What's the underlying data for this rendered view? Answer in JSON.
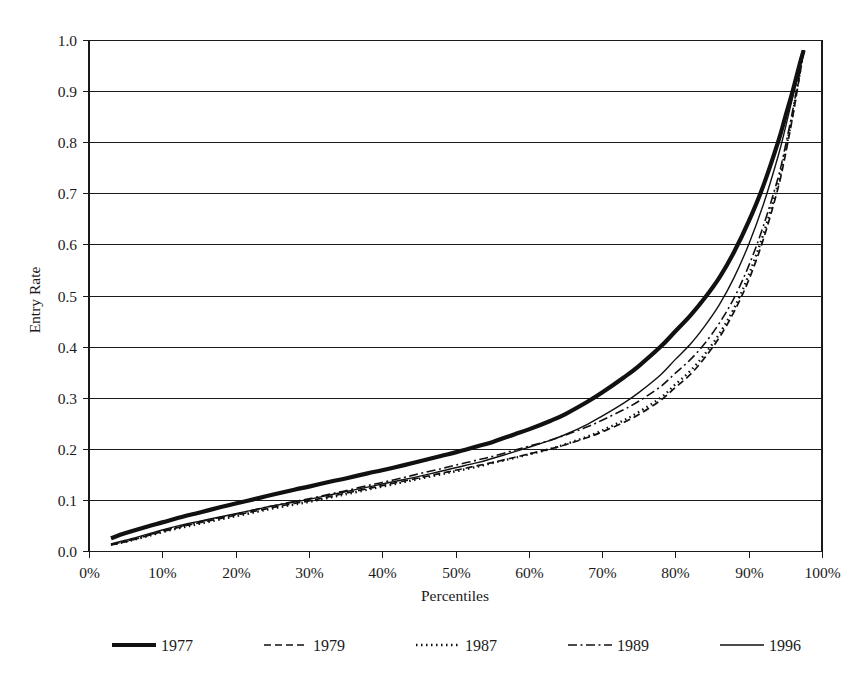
{
  "chart_data": {
    "type": "line",
    "title": "",
    "xlabel": "Percentiles",
    "ylabel": "Entry Rate",
    "xlim": [
      0,
      100
    ],
    "ylim": [
      0.0,
      1.0
    ],
    "grid": "horizontal",
    "legend_position": "bottom",
    "x_tick_labels": [
      "0%",
      "10%",
      "20%",
      "30%",
      "40%",
      "50%",
      "60%",
      "70%",
      "80%",
      "90%",
      "100%"
    ],
    "x_tick_values": [
      0,
      10,
      20,
      30,
      40,
      50,
      60,
      70,
      80,
      90,
      100
    ],
    "y_tick_labels": [
      "0.0",
      "0.1",
      "0.2",
      "0.3",
      "0.4",
      "0.5",
      "0.6",
      "0.7",
      "0.8",
      "0.9",
      "1.0"
    ],
    "y_tick_values": [
      0.0,
      0.1,
      0.2,
      0.3,
      0.4,
      0.5,
      0.6,
      0.7,
      0.8,
      0.9,
      1.0
    ],
    "x": [
      3,
      5,
      8,
      10,
      13,
      15,
      18,
      20,
      23,
      25,
      28,
      30,
      33,
      35,
      38,
      40,
      43,
      45,
      48,
      50,
      53,
      55,
      58,
      60,
      63,
      65,
      68,
      70,
      73,
      75,
      78,
      80,
      82,
      84,
      86,
      88,
      90,
      92,
      94,
      95,
      96,
      97,
      97.5
    ],
    "series": [
      {
        "name": "1977",
        "style": "solid-thick",
        "stroke_width": 4.2,
        "dash": "none",
        "values": [
          0.025,
          0.035,
          0.048,
          0.056,
          0.068,
          0.075,
          0.086,
          0.093,
          0.103,
          0.11,
          0.12,
          0.126,
          0.136,
          0.142,
          0.152,
          0.158,
          0.168,
          0.175,
          0.186,
          0.193,
          0.205,
          0.213,
          0.228,
          0.238,
          0.255,
          0.268,
          0.292,
          0.31,
          0.34,
          0.362,
          0.4,
          0.43,
          0.46,
          0.495,
          0.535,
          0.585,
          0.645,
          0.715,
          0.8,
          0.85,
          0.9,
          0.955,
          0.98
        ]
      },
      {
        "name": "1979",
        "style": "dashed",
        "stroke_width": 1.7,
        "dash": "7,4",
        "values": [
          0.012,
          0.018,
          0.03,
          0.038,
          0.049,
          0.055,
          0.064,
          0.07,
          0.079,
          0.085,
          0.093,
          0.098,
          0.107,
          0.113,
          0.122,
          0.128,
          0.137,
          0.143,
          0.152,
          0.158,
          0.167,
          0.173,
          0.183,
          0.19,
          0.2,
          0.208,
          0.222,
          0.233,
          0.252,
          0.267,
          0.295,
          0.32,
          0.345,
          0.378,
          0.418,
          0.468,
          0.53,
          0.61,
          0.71,
          0.775,
          0.85,
          0.935,
          0.98
        ]
      },
      {
        "name": "1987",
        "style": "dotted",
        "stroke_width": 2.4,
        "dash": "1.5,3.5",
        "values": [
          0.012,
          0.018,
          0.029,
          0.037,
          0.047,
          0.053,
          0.062,
          0.068,
          0.077,
          0.083,
          0.091,
          0.096,
          0.105,
          0.111,
          0.12,
          0.126,
          0.135,
          0.141,
          0.15,
          0.156,
          0.165,
          0.172,
          0.182,
          0.189,
          0.2,
          0.209,
          0.224,
          0.236,
          0.256,
          0.272,
          0.3,
          0.326,
          0.352,
          0.385,
          0.425,
          0.475,
          0.54,
          0.62,
          0.718,
          0.782,
          0.855,
          0.938,
          0.98
        ]
      },
      {
        "name": "1989",
        "style": "dash-dot",
        "stroke_width": 1.6,
        "dash": "9,3.5,2,3.5",
        "values": [
          0.013,
          0.019,
          0.031,
          0.039,
          0.05,
          0.057,
          0.066,
          0.072,
          0.082,
          0.088,
          0.097,
          0.102,
          0.112,
          0.118,
          0.128,
          0.134,
          0.144,
          0.151,
          0.161,
          0.168,
          0.178,
          0.185,
          0.197,
          0.205,
          0.217,
          0.227,
          0.243,
          0.256,
          0.277,
          0.293,
          0.322,
          0.348,
          0.374,
          0.406,
          0.446,
          0.495,
          0.558,
          0.636,
          0.73,
          0.792,
          0.862,
          0.94,
          0.98
        ]
      },
      {
        "name": "1996",
        "style": "solid-thin",
        "stroke_width": 1.4,
        "dash": "none",
        "values": [
          0.014,
          0.021,
          0.033,
          0.041,
          0.052,
          0.058,
          0.067,
          0.073,
          0.082,
          0.088,
          0.096,
          0.101,
          0.11,
          0.116,
          0.125,
          0.131,
          0.14,
          0.146,
          0.156,
          0.163,
          0.173,
          0.181,
          0.194,
          0.203,
          0.217,
          0.228,
          0.248,
          0.264,
          0.29,
          0.31,
          0.345,
          0.375,
          0.404,
          0.44,
          0.482,
          0.535,
          0.6,
          0.678,
          0.772,
          0.828,
          0.888,
          0.95,
          0.98
        ]
      }
    ]
  },
  "axes": {
    "y_title": "Entry Rate",
    "x_title": "Percentiles"
  },
  "legend": {
    "items": [
      {
        "label": "1977",
        "style": "solid-thick"
      },
      {
        "label": "1979",
        "style": "dashed"
      },
      {
        "label": "1987",
        "style": "dotted"
      },
      {
        "label": "1989",
        "style": "dash-dot"
      },
      {
        "label": "1996",
        "style": "solid-thin"
      }
    ]
  },
  "colors": {
    "ink": "#1a1a1a",
    "background": "#ffffff"
  }
}
